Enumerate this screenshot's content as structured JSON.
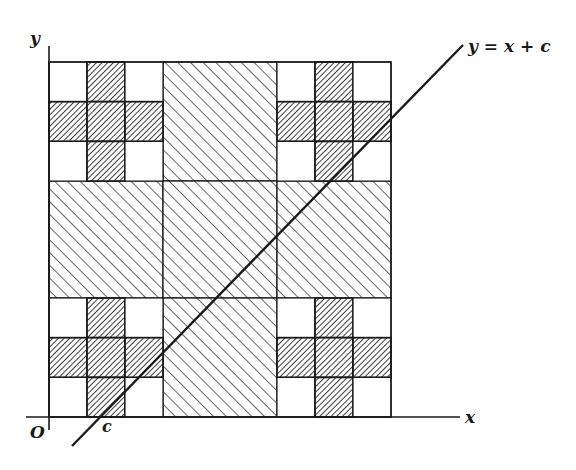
{
  "figure": {
    "type": "geometric-diagram",
    "labels": {
      "y_axis": "y",
      "x_axis": "x",
      "origin": "O",
      "intercept": "c",
      "line_equation": "y = x + c"
    },
    "colors": {
      "ink": "#1a1a1a",
      "background": "#ffffff"
    },
    "layout": {
      "square": {
        "x0": 49,
        "y0": 62,
        "x1": 391,
        "y1": 417
      },
      "col_edges": [
        49,
        87,
        125,
        163,
        277,
        315,
        353,
        391
      ],
      "row_edges": [
        62,
        101,
        141,
        181,
        298,
        338,
        378,
        417
      ],
      "coarse_blocks": [
        {
          "name": "top-middle",
          "x0": 163,
          "y0": 62,
          "x1": 277,
          "y1": 181
        },
        {
          "name": "middle-left",
          "x0": 49,
          "y0": 181,
          "x1": 163,
          "y1": 298
        },
        {
          "name": "center",
          "x0": 163,
          "y0": 181,
          "x1": 277,
          "y1": 298
        },
        {
          "name": "middle-right",
          "x0": 277,
          "y0": 181,
          "x1": 391,
          "y1": 298
        },
        {
          "name": "bottom-middle",
          "x0": 163,
          "y0": 298,
          "x1": 277,
          "y1": 417
        }
      ],
      "corner_crosses": [
        {
          "name": "top-left",
          "x0": 49,
          "y0": 62
        },
        {
          "name": "top-right",
          "x0": 277,
          "y0": 62
        },
        {
          "name": "bottom-left",
          "x0": 49,
          "y0": 298
        },
        {
          "name": "bottom-right",
          "x0": 277,
          "y0": 298
        }
      ],
      "line": {
        "x1": 72,
        "y1": 446,
        "x2": 463,
        "y2": 45
      }
    }
  }
}
